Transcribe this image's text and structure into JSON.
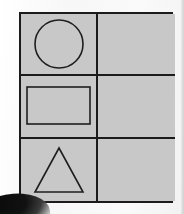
{
  "scene": {
    "title": "Shapes grid worksheet",
    "background_color": "#fcfcfc",
    "sheet_color": "#c8c8c8",
    "border_color": "#1b1b1b",
    "shape_stroke_color": "#1e1e1e",
    "shadow_color": "#0a0a0a"
  },
  "grid": {
    "columns": 2,
    "rows": 3,
    "cells": [
      {
        "row": 1,
        "column": 1,
        "shape": "circle",
        "shape_label": "circle",
        "empty": false
      },
      {
        "row": 1,
        "column": 2,
        "shape": "none",
        "shape_label": "",
        "empty": true
      },
      {
        "row": 2,
        "column": 1,
        "shape": "rectangle",
        "shape_label": "rectangle",
        "empty": false
      },
      {
        "row": 2,
        "column": 2,
        "shape": "none",
        "shape_label": "",
        "empty": true
      },
      {
        "row": 3,
        "column": 1,
        "shape": "triangle",
        "shape_label": "triangle",
        "empty": false
      },
      {
        "row": 3,
        "column": 2,
        "shape": "none",
        "shape_label": "",
        "empty": true
      }
    ]
  },
  "shapes": {
    "circle": {
      "name": "circle",
      "center_x": 36,
      "center_y": 30,
      "radius": 24
    },
    "rectangle": {
      "name": "rectangle",
      "x": 5,
      "y": 10,
      "width": 63,
      "height": 37
    },
    "triangle": {
      "name": "triangle",
      "apex_x": 37,
      "apex_y": 8,
      "left_x": 13,
      "right_x": 61,
      "base_y": 52
    }
  }
}
